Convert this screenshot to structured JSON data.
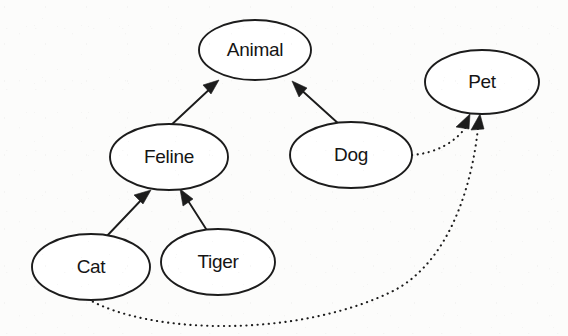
{
  "diagram": {
    "type": "uml-class-hierarchy",
    "background_color": "#fcfcfb",
    "stroke_color": "#1c1c1c",
    "node_fill_color": "#ffffff",
    "nodes": [
      {
        "id": "animal",
        "label": "Animal",
        "cx": 255,
        "cy": 50,
        "rx": 56,
        "ry": 30
      },
      {
        "id": "pet",
        "label": "Pet",
        "cx": 482,
        "cy": 82,
        "rx": 57,
        "ry": 32
      },
      {
        "id": "feline",
        "label": "Feline",
        "cx": 169,
        "cy": 157,
        "rx": 59,
        "ry": 33
      },
      {
        "id": "dog",
        "label": "Dog",
        "cx": 351,
        "cy": 155,
        "rx": 61,
        "ry": 33
      },
      {
        "id": "cat",
        "label": "Cat",
        "cx": 91,
        "cy": 267,
        "rx": 59,
        "ry": 33
      },
      {
        "id": "tiger",
        "label": "Tiger",
        "cx": 218,
        "cy": 262,
        "rx": 57,
        "ry": 33
      }
    ],
    "edges": [
      {
        "id": "feline-animal",
        "from": "feline",
        "to": "animal",
        "style": "solid",
        "arrow": "open-filled"
      },
      {
        "id": "dog-animal",
        "from": "dog",
        "to": "animal",
        "style": "solid",
        "arrow": "open-filled"
      },
      {
        "id": "cat-feline",
        "from": "cat",
        "to": "feline",
        "style": "solid",
        "arrow": "open-filled"
      },
      {
        "id": "tiger-feline",
        "from": "tiger",
        "to": "feline",
        "style": "solid",
        "arrow": "open-filled"
      },
      {
        "id": "dog-pet",
        "from": "dog",
        "to": "pet",
        "style": "dotted",
        "arrow": "open-filled"
      },
      {
        "id": "cat-pet",
        "from": "cat",
        "to": "pet",
        "style": "dotted",
        "arrow": "open-filled"
      }
    ]
  }
}
